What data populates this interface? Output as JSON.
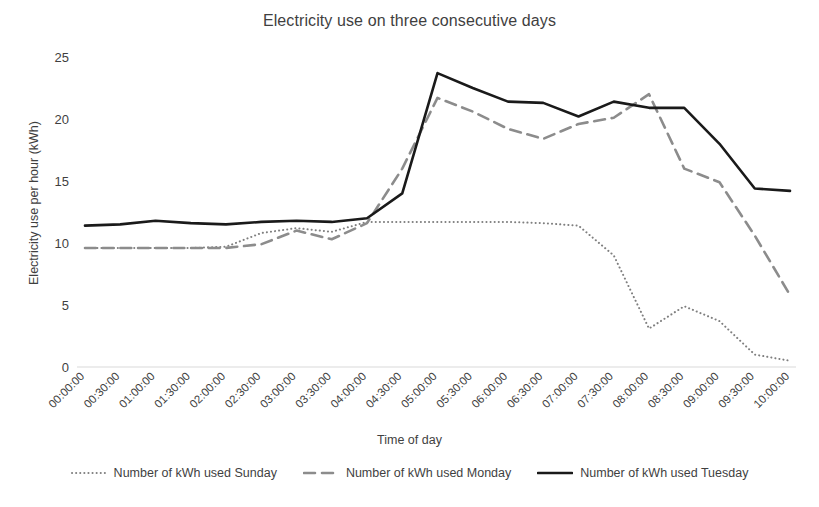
{
  "chart_data": {
    "type": "line",
    "title": "Electricity use on three consecutive days",
    "xlabel": "Time of day",
    "ylabel": "Electricity use per hour (kWh)",
    "ylim": [
      0,
      25
    ],
    "yticks": [
      0,
      5,
      10,
      15,
      20,
      25
    ],
    "grid": false,
    "legend_position": "bottom",
    "categories": [
      "00:00:00",
      "00:30:00",
      "01:00:00",
      "01:30:00",
      "02:00:00",
      "02:30:00",
      "03:00:00",
      "03:30:00",
      "04:00:00",
      "04:30:00",
      "05:00:00",
      "05:30:00",
      "06:00:00",
      "06:30:00",
      "07:00:00",
      "07:30:00",
      "08:00:00",
      "08:30:00",
      "09:00:00",
      "09:30:00",
      "10:00:00"
    ],
    "series": [
      {
        "name": "Number of kWh used Sunday",
        "color": "#7f7f7f",
        "style": "dotted",
        "width": 2,
        "values": [
          9.6,
          9.6,
          9.6,
          9.6,
          9.7,
          10.8,
          11.2,
          10.9,
          11.7,
          11.7,
          11.7,
          11.7,
          11.7,
          11.6,
          11.4,
          9.0,
          3.1,
          4.9,
          3.7,
          1.0,
          0.5
        ]
      },
      {
        "name": "Number of kWh used Monday",
        "color": "#8c8c8c",
        "style": "dashed",
        "width": 2.6,
        "values": [
          9.6,
          9.6,
          9.6,
          9.6,
          9.6,
          9.9,
          11.0,
          10.3,
          11.6,
          16.0,
          21.7,
          20.6,
          19.2,
          18.4,
          19.6,
          20.1,
          22.0,
          16.0,
          14.9,
          10.6,
          5.8
        ]
      },
      {
        "name": "Number of kWh used Tuesday",
        "color": "#1a1a1a",
        "style": "solid",
        "width": 2.6,
        "values": [
          11.4,
          11.5,
          11.8,
          11.6,
          11.5,
          11.7,
          11.8,
          11.7,
          12.0,
          14.0,
          23.7,
          22.5,
          21.4,
          21.3,
          20.2,
          21.4,
          20.9,
          20.9,
          18.0,
          14.4,
          14.2
        ]
      }
    ]
  },
  "legend": {
    "items": [
      {
        "label": "Number of kWh used Sunday"
      },
      {
        "label": "Number of kWh used Monday"
      },
      {
        "label": "Number of kWh used Tuesday"
      }
    ]
  }
}
